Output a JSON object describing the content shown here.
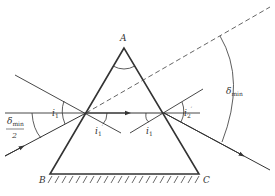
{
  "diagram": {
    "vertices": {
      "A": {
        "label": "A",
        "x": 124,
        "y": 48
      },
      "B": {
        "label": "B",
        "x": 50,
        "y": 174
      },
      "C": {
        "label": "C",
        "x": 199,
        "y": 174
      }
    },
    "labels": {
      "apex": "A",
      "base_left": "B",
      "base_right": "C",
      "incident_angle": "i",
      "incident_angle_sub": "1",
      "refracted_angle": "i",
      "refracted_angle_sub": "1",
      "refracted_angle_prime": "′",
      "internal_angle": "i",
      "internal_angle_sub": "1",
      "exit_angle": "i",
      "exit_angle_sub": "2",
      "exit_angle_prime": "′",
      "delta_min": "δ",
      "delta_min_sub": "min",
      "half_delta_numer": "δ",
      "half_delta_numer_sub": "min",
      "half_delta_denom": "2"
    },
    "colors": {
      "line": "#333333",
      "background": "#ffffff"
    }
  }
}
